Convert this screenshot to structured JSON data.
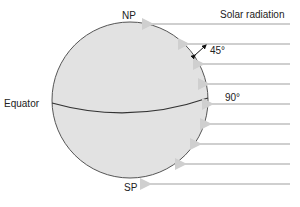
{
  "labels": {
    "north_pole": "NP",
    "south_pole": "SP",
    "equator": "Equator",
    "solar_radiation": "Solar radiation",
    "angle_45": "45°",
    "angle_90": "90°"
  },
  "colors": {
    "sphere_fill": "#e2e2e2",
    "sphere_stroke": "#555555",
    "ray_color": "#cfcfcf"
  }
}
